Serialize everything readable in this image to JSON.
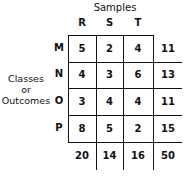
{
  "column_group_label": "Samples",
  "row_group_label": [
    "Classes",
    "or",
    "Outcomes"
  ],
  "columns": [
    "R",
    "S",
    "T"
  ],
  "rows": [
    {
      "label": "M",
      "values": [
        5,
        2,
        4
      ],
      "total": 11
    },
    {
      "label": "N",
      "values": [
        4,
        3,
        6
      ],
      "total": 13
    },
    {
      "label": "O",
      "values": [
        3,
        4,
        4
      ],
      "total": 11
    },
    {
      "label": "P",
      "values": [
        8,
        5,
        2
      ],
      "total": 15
    }
  ],
  "column_totals": [
    20,
    14,
    16
  ],
  "grand_total": 50
}
